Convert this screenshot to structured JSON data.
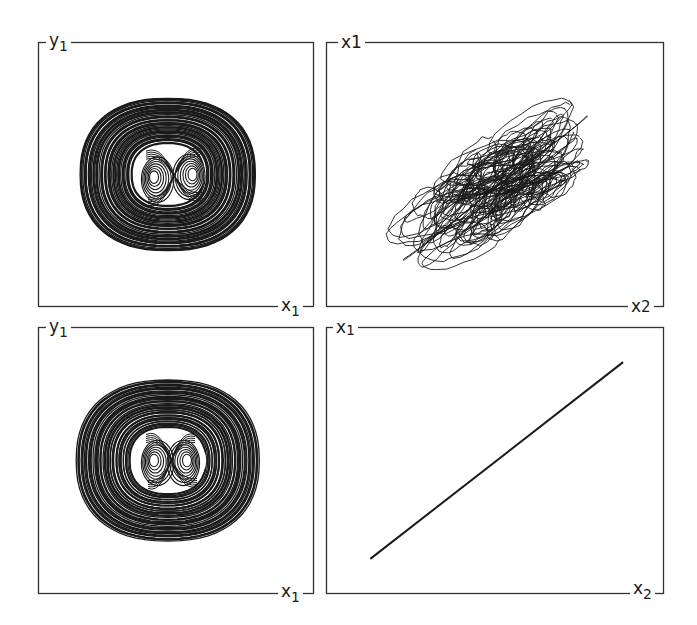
{
  "chart_data": [
    {
      "id": "top-left",
      "type": "line",
      "subtype": "phase-portrait",
      "ylabel": {
        "base": "y",
        "sub": "1"
      },
      "xlabel": {
        "base": "x",
        "sub": "1"
      },
      "description": "Dense nested elliptical orbits (outer torus-like rings) surrounding an inner double-scroll (figure-eight) attractor",
      "outer_ellipse": {
        "cx": 0.47,
        "cy": 0.5,
        "rx": 0.32,
        "ry": 0.29
      },
      "inner_lobes": [
        {
          "cx": 0.42,
          "cy": 0.51
        },
        {
          "cx": 0.56,
          "cy": 0.5
        }
      ],
      "grid": false
    },
    {
      "id": "top-right",
      "type": "line",
      "subtype": "synchronization-plot",
      "ylabel": {
        "base": "x",
        "sub": "1"
      },
      "xlabel": {
        "base": "x",
        "sub": "2"
      },
      "description": "Tangled chaotic cloud elongated along the diagonal: x1 vs x2 not synchronized",
      "cloud": {
        "cx": 0.5,
        "cy": 0.55,
        "major": 0.36,
        "minor": 0.17,
        "angle_deg": -38
      },
      "grid": false
    },
    {
      "id": "bottom-left",
      "type": "line",
      "subtype": "phase-portrait",
      "ylabel": {
        "base": "y",
        "sub": "1"
      },
      "xlabel": {
        "base": "x",
        "sub": "1"
      },
      "description": "Dense nested elliptical orbits surrounding a clearer inner double-scroll (figure-eight) attractor",
      "outer_ellipse": {
        "cx": 0.47,
        "cy": 0.5,
        "rx": 0.33,
        "ry": 0.3
      },
      "inner_lobes": [
        {
          "cx": 0.42,
          "cy": 0.5
        },
        {
          "cx": 0.54,
          "cy": 0.5
        }
      ],
      "grid": false
    },
    {
      "id": "bottom-right",
      "type": "line",
      "subtype": "synchronization-plot",
      "ylabel": {
        "base": "x",
        "sub": "1"
      },
      "xlabel": {
        "base": "x",
        "sub": "2"
      },
      "description": "Straight diagonal line: x1 = x2, complete synchronization",
      "x": [
        0.13,
        0.88
      ],
      "y": [
        0.13,
        0.87
      ],
      "grid": false
    }
  ],
  "labels": {
    "tl_y": {
      "base": "y",
      "sub": "1"
    },
    "tl_x": {
      "base": "x",
      "sub": "1"
    },
    "tr_y": {
      "base": "x",
      "sub": "1"
    },
    "tr_x": {
      "base": "x",
      "sub": "2"
    },
    "bl_y": {
      "base": "y",
      "sub": "1"
    },
    "bl_x": {
      "base": "x",
      "sub": "1"
    },
    "br_y": {
      "base": "x",
      "sub": "1"
    },
    "br_x": {
      "base": "x",
      "sub": "2"
    }
  },
  "colors": {
    "ink": "#1a1a1a",
    "frame": "#333333",
    "background": "#ffffff"
  }
}
